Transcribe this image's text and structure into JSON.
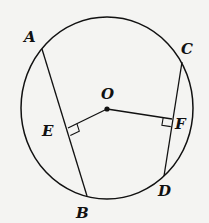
{
  "diagram": {
    "type": "circle-chords",
    "stroke": "#111111",
    "background": "#f4f4f2",
    "circle": {
      "cx": 107,
      "cy": 108,
      "rx": 86,
      "ry": 91
    },
    "points": {
      "A": {
        "x": 42,
        "y": 49,
        "label": "A",
        "lx": 24,
        "ly": 42
      },
      "B": {
        "x": 87,
        "y": 196,
        "label": "B",
        "lx": 76,
        "ly": 218
      },
      "C": {
        "x": 182,
        "y": 62,
        "label": "C",
        "lx": 181,
        "ly": 54
      },
      "D": {
        "x": 164,
        "y": 176,
        "label": "D",
        "lx": 158,
        "ly": 196
      },
      "E": {
        "x": 68,
        "y": 128,
        "label": "E",
        "lx": 42,
        "ly": 136
      },
      "F": {
        "x": 172,
        "y": 119,
        "label": "F",
        "lx": 175,
        "ly": 129
      },
      "O": {
        "x": 107,
        "y": 109,
        "label": "O",
        "lx": 101,
        "ly": 99
      }
    },
    "segments": [
      "AB",
      "CD",
      "OE",
      "OF"
    ],
    "right_angles": [
      "E",
      "F"
    ]
  }
}
